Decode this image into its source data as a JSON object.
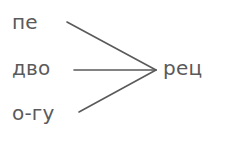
{
  "diagram": {
    "type": "word-matching-diagram",
    "background_color": "#ffffff",
    "stroke_color": "#5a5a5a",
    "text_color": "#5a5a5a",
    "font_size_px": 20,
    "left_items": [
      {
        "id": "pe",
        "label": "пе",
        "x": 12,
        "y": 12
      },
      {
        "id": "dvo",
        "label": "дво",
        "x": 12,
        "y": 58
      },
      {
        "id": "o-gu",
        "label": "о-гу",
        "x": 12,
        "y": 103
      }
    ],
    "right_items": [
      {
        "id": "rets",
        "label": "рец",
        "x": 163,
        "y": 58
      }
    ],
    "connections": [
      {
        "from": "pe",
        "to": "rets",
        "x1": 67,
        "y1": 22,
        "x2": 156,
        "y2": 70
      },
      {
        "from": "dvo",
        "to": "rets",
        "x1": 74,
        "y1": 70,
        "x2": 156,
        "y2": 70
      },
      {
        "from": "o-gu",
        "to": "rets",
        "x1": 79,
        "y1": 112,
        "x2": 156,
        "y2": 70
      }
    ]
  }
}
